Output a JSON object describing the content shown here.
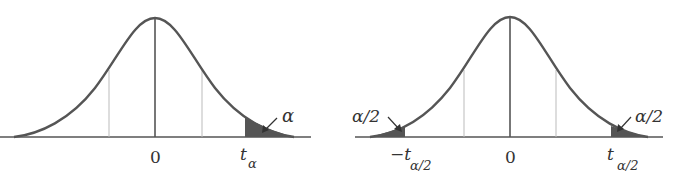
{
  "figure": {
    "panels": [
      {
        "name": "one-tailed",
        "center_label": "0",
        "critical_label_main": "t",
        "critical_label_sub": "α",
        "area_label": "α"
      },
      {
        "name": "two-tailed",
        "center_label": "0",
        "left_critical_label_main": "−t",
        "left_critical_label_sub": "α/2",
        "right_critical_label_main": "t",
        "right_critical_label_sub": "α/2",
        "left_area_label": "α/2",
        "right_area_label": "α/2"
      }
    ],
    "colors": {
      "curve": "#555555",
      "axis": "#555555",
      "center_line": "#555555",
      "guide_lines": "#bbbbbb",
      "shade": "#555555",
      "text": "#333333"
    }
  }
}
